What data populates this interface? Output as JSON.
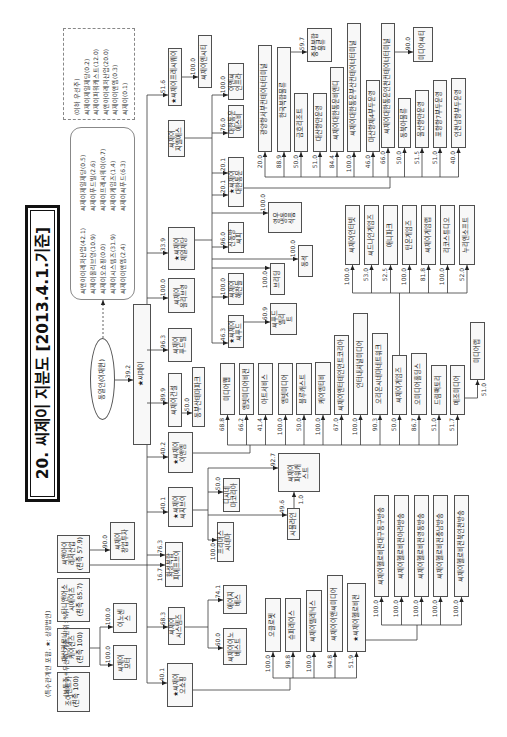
{
  "title": "20. 씨제이 지분도 [2013.4.1.기준]",
  "legend": {
    "note": "(특수관계인 포함, ★: 상장법인)",
    "unit": "(보통주+우선주 기준, 단위: %)"
  },
  "notes": {
    "preferred": "(이하 우선주)\n씨제이제일제당(0.2)\n씨제이파워캐스트(12.0)\n씨앤아이레저산업(20.0)\n씨제이이앤엠(0.3)\n씨제이(0.1)",
    "holdings_upper": "씨제이제일제당(0.5)\n씨제이푸드빌(2.6)\n씨제이프레시웨이(0.7)\n씨제이게임즈(1.4)\n씨제이씨푸드(6.3)",
    "holdings_lower": "씨앤아이레저산업(42.1)\n씨제이올리브영(10.9)\n씨제이오쇼핑(0.0)\n씨제이시스템즈(31.9)\n씨제이이앤엠(2.4)"
  },
  "controller": {
    "name": "동일인(이재현)"
  },
  "family": {
    "o1": "씨앤아이\n레저산업\n(친족 57.9)",
    "o2": "타니앤어소\n시에이츠\n(친족 85.7)",
    "o3": "재산커뮤니\n케이션즈\n(친족 100)",
    "o4": "조이렌트카\n(친족 100)"
  },
  "nodes": {
    "root": "★씨제이",
    "freshway": "★씨제이프레시웨이",
    "freshway_sub": "씨제이엔시티",
    "gls": "씨제이\n지엘에스",
    "cheiljedang": "★씨제이\n제일제당",
    "oliveyoung": "씨제이\n올리브영",
    "foodville": "씨제이\n푸드빌",
    "construction": "씨제이건설",
    "dongbusan": "동부산테마파크",
    "enm": "★씨제이\n이앤엠",
    "cgv": "★씨제이\n씨지브이",
    "hwaseong": "화성복합\n피에프브이",
    "systems": "씨제이\n시스템즈",
    "oshopping": "★씨제이\n오쇼핑",
    "venture": "씨제이\n창업투자",
    "innocence": "이노센\n스",
    "motor": "씨제이\n모터",
    "enc_infra": "이엔씨\n인프라",
    "kx_sb": "대한통운\n에스비",
    "korea_express": "★씨제이\n대한통운",
    "youngwoo": "영우\n냉동\n식품",
    "shindongbang": "신동방\n씨피",
    "dongseok": "동석",
    "breeding": "브리딩",
    "haechandle": "씨제이\n해찬들",
    "seafood": "★씨제이\n씨푸드",
    "seafood_sub": "씨푸드\n엘리\n트",
    "kx": {
      "t1": "광양항서부컨테이너터미널",
      "t2": "한국복합물류",
      "t3": "금호리조트",
      "t4": "대산항만운영",
      "t5": "씨제이대한통운비엔디",
      "t6": "씨제이대한통운부산컨테이너터미널",
      "t7": "마산항제4부두운영",
      "t8": "씨제이대한통운인천컨테이너터미널",
      "t9": "동북아물류",
      "t10": "울산항만운영",
      "t11": "포항항7부두운영",
      "t12": "인천남항부두운영",
      "t2_sub": "중부복합\n물류",
      "t8_sub": "미디어씨티"
    },
    "enm_subs": {
      "e1": "미디어웹",
      "e2": "엠넷미디어비전",
      "e3": "아트서비스",
      "e4": "엠넷미디어",
      "e5": "블루캐스트",
      "e6": "케이엠티비",
      "e7": "씨제이엔터테인먼트코리아",
      "e8": "인터내셔널미디어",
      "e9": "오리온시네마네트워크",
      "e10": "씨제이게임즈",
      "e11": "오미디어홀딩스",
      "e12": "드림팩토리",
      "e13": "메조미디어",
      "e14": "미디어랩"
    },
    "games": {
      "g1": "씨제이인터넷",
      "g2": "씨드나인게임즈",
      "g3": "애니파크",
      "g4": "턴온게임즈",
      "g5": "씨제이게임랩",
      "g6": "리코스튜디오",
      "g7": "누리엔소프트"
    },
    "cgv_subs": {
      "powercast": "씨제이\n파워캐\n스트",
      "dcinema": "디시네\n마코리아",
      "simuline": "시뮬라인",
      "primus": "프리머스\n시네마"
    },
    "systems_subs": {
      "agbes": "에이지\n베스",
      "innovest": "씨제이이노\n베스트"
    },
    "oshopping_subs": {
      "s1": "오클로젯",
      "s2": "슈퍼레이스",
      "s3": "씨제이텔레닉스",
      "s4": "씨제이이앤씨미디어",
      "s5": "★씨제이헬로비전"
    },
    "hellovision_subs": {
      "h1": "씨제이헬로비전대구동구방송",
      "h2": "씨제이헬로비전아라방송",
      "h3": "씨제이헬로비전영동방송",
      "h4": "씨제이헬로비전충남방송",
      "h5": "씨제이헬로비전북인천방송"
    }
  },
  "stakes": {
    "root": "39.2",
    "freshway": "51.6",
    "cheiljedang": "33.9",
    "oliveyoung": "100.0",
    "foodville": "96.3",
    "construction": "89.9",
    "enm": "40.2",
    "cgv": "40.1",
    "hwaseong": "76.3",
    "hwaseong_family": "16.7",
    "systems": "68.3",
    "oshopping": "40.1",
    "freshway_sub": "100.0",
    "dongbusan": "50.0",
    "enc_infra": "100.0",
    "kx_sb": "76.0",
    "kx_a": "20.1",
    "kx_b": "20.1",
    "youngwoo": "100.0",
    "shindongbang": "96.0",
    "dongseok": "100.0",
    "breeding": "100.0",
    "haechandle": "100.0",
    "seafood": "46.3",
    "seafood_sub": "60.9",
    "t1": "20.0",
    "t2": "88.9",
    "t3": "50.0",
    "t4": "51.0",
    "t5": "84.4",
    "t6": "100.0",
    "t7": "46.0",
    "t8": "66.0",
    "t9": "50.0",
    "t10": "51.5",
    "t11": "51.0",
    "t12": "40.0",
    "t2_sub": "59.7",
    "t8_sub": "90.0",
    "e1": "68.8",
    "e2": "66.2",
    "e3": "41.4",
    "e4": "100.0",
    "e5": "50.0",
    "e6": "100.0",
    "e7": "67.0",
    "e8": "100.0",
    "e9": "90.3",
    "e10": "50.0",
    "e11": "86.7",
    "e12": "51.0",
    "e13": "51.7",
    "e14": "51.0",
    "g1": "100.0",
    "g2": "53.0",
    "g3": "52.5",
    "g4": "100.0",
    "g5": "81.8",
    "g6": "100.0",
    "g7": "52.0",
    "powercast": "92.7",
    "dcinema": "50.0",
    "simuline": "49.6",
    "primus": "100.0",
    "simuline_powercast": "1.0",
    "agbes": "74.1",
    "innovest": "60.0",
    "s1": "100.0",
    "s2": "98.8",
    "s3": "100.0",
    "s4": "94.8",
    "s5": "51.9",
    "h1": "100.0",
    "h2": "100.0",
    "h3": "100.0",
    "h4": "100.0",
    "h5": "100.0",
    "venture": "90.0",
    "innocence": "100.0",
    "motor": "100.0"
  }
}
